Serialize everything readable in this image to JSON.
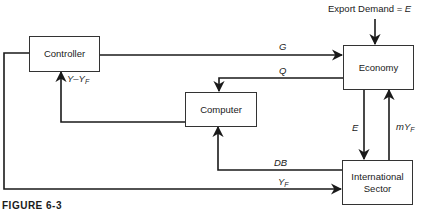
{
  "diagram": {
    "nodes": {
      "controller": "Controller",
      "economy": "Economy",
      "computer": "Computer",
      "international_sector_line1": "International",
      "international_sector_line2": "Sector"
    },
    "external_input": {
      "label": "Export Demand = ",
      "var": "E"
    },
    "edges": {
      "G": "G",
      "Q": "Q",
      "E": "E",
      "mYF_main": "mY",
      "mYF_sub": "F",
      "DB": "DB",
      "YF_main": "Y",
      "YF_sub": "F",
      "YminusYF_main": "Y–Y",
      "YminusYF_sub": "F"
    },
    "caption": "FIGURE 6-3"
  }
}
